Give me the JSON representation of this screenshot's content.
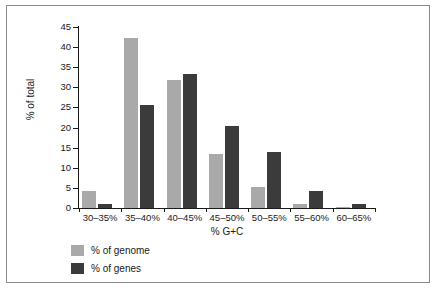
{
  "chart_data": {
    "type": "bar",
    "title": "",
    "xlabel": "% G+C",
    "ylabel": "% of total",
    "categories": [
      "30–35%",
      "35–40%",
      "40–45%",
      "45–50%",
      "50–55%",
      "55–60%",
      "60–65%"
    ],
    "series": [
      {
        "name": "% of genome",
        "color": "#a9a9a9",
        "values": [
          4.3,
          42.3,
          31.8,
          13.5,
          5.3,
          0.9,
          0.3
        ]
      },
      {
        "name": "% of genes",
        "color": "#3b3b3b",
        "values": [
          0.9,
          25.5,
          33.2,
          20.5,
          14.0,
          4.3,
          0.9
        ]
      }
    ],
    "ylim": [
      0,
      45
    ],
    "yticks": [
      0,
      5,
      10,
      15,
      20,
      25,
      30,
      35,
      40,
      45
    ],
    "ytick_labels": [
      "0",
      "5",
      "10",
      "15",
      "20",
      "25",
      "30",
      "35",
      "40",
      "45"
    ],
    "grid": false,
    "legend_position": "bottom-left",
    "legend": [
      "% of genome",
      "% of genes"
    ]
  },
  "figure": {
    "background_color": "#ffffff",
    "frame_color": "#8a8a8a",
    "axis_color": "#1a1a1a"
  }
}
